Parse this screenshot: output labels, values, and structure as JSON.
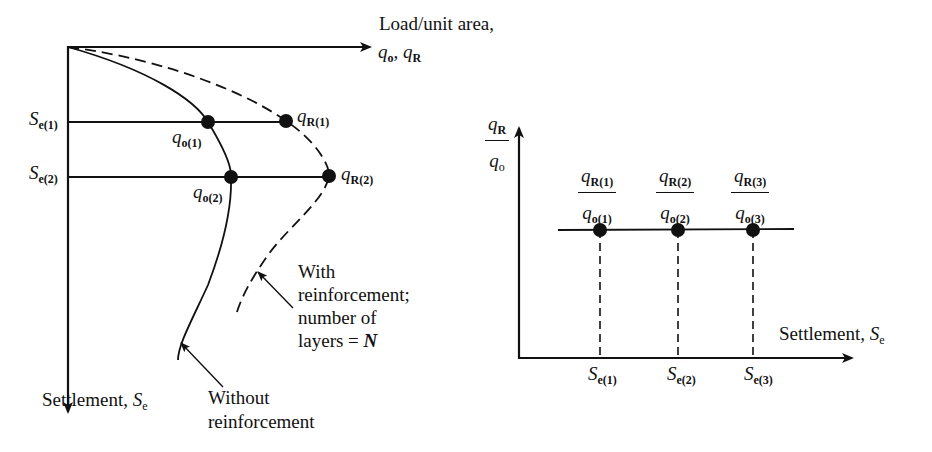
{
  "left_diagram": {
    "x_axis_label_line1": "Load/unit area,",
    "x_axis_label_line2_q": "q",
    "x_axis_label_line2_sub1": "o",
    "x_axis_label_line2_sep": ", ",
    "x_axis_label_line2_sub2": "R",
    "y_axis_label": "Settlement, ",
    "y_axis_symbol": "S",
    "y_axis_symbol_sub": "e",
    "settlement_levels": [
      {
        "symbol": "S",
        "sub": "e(1)"
      },
      {
        "symbol": "S",
        "sub": "e(2)"
      }
    ],
    "points_unreinforced": [
      {
        "symbol": "q",
        "sub": "o(1)"
      },
      {
        "symbol": "q",
        "sub": "o(2)"
      }
    ],
    "points_reinforced": [
      {
        "symbol": "q",
        "sub": "R(1)"
      },
      {
        "symbol": "q",
        "sub": "R(2)"
      }
    ],
    "annotation_reinforced": [
      "With",
      "reinforcement;",
      "number of",
      "layers = "
    ],
    "annotation_reinforced_N": "N",
    "annotation_unreinforced": [
      "Without",
      "reinforcement"
    ]
  },
  "right_diagram": {
    "y_axis_num": "q",
    "y_axis_num_sub": "R",
    "y_axis_den": "q",
    "y_axis_den_sub": "o",
    "x_axis_label": "Settlement, ",
    "x_axis_symbol": "S",
    "x_axis_symbol_sub": "e",
    "ratios": [
      {
        "num": "q",
        "num_sub": "R(1)",
        "den": "q",
        "den_sub": "o(1)",
        "x_label": "S",
        "x_sub": "e(1)"
      },
      {
        "num": "q",
        "num_sub": "R(2)",
        "den": "q",
        "den_sub": "o(2)",
        "x_label": "S",
        "x_sub": "e(2)"
      },
      {
        "num": "q",
        "num_sub": "R(3)",
        "den": "q",
        "den_sub": "o(3)",
        "x_label": "S",
        "x_sub": "e(3)"
      }
    ]
  },
  "colors": {
    "ink": "#111111",
    "background": "#ffffff"
  }
}
